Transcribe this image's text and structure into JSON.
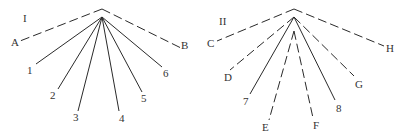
{
  "diagrams": [
    {
      "title": "I",
      "title_pos": [
        23,
        22
      ],
      "apex_outer": [
        102,
        9
      ],
      "apex_inner": [
        102,
        17
      ],
      "lines": [
        {
          "label": "A",
          "style": "dashed",
          "from": "outer",
          "end": [
            20,
            41
          ],
          "label_pos": [
            11,
            46
          ]
        },
        {
          "label": "B",
          "style": "dashed",
          "from": "outer",
          "end": [
            181,
            48
          ],
          "label_pos": [
            181,
            49
          ]
        },
        {
          "label": "1",
          "style": "solid",
          "from": "inner",
          "end": [
            36,
            64
          ],
          "label_pos": [
            27,
            74
          ]
        },
        {
          "label": "2",
          "style": "solid",
          "from": "inner",
          "end": [
            58,
            89
          ],
          "label_pos": [
            50,
            99
          ]
        },
        {
          "label": "3",
          "style": "solid",
          "from": "inner",
          "end": [
            78,
            111
          ],
          "label_pos": [
            73,
            121
          ]
        },
        {
          "label": "4",
          "style": "solid",
          "from": "inner",
          "end": [
            119,
            111
          ],
          "label_pos": [
            119,
            122
          ]
        },
        {
          "label": "5",
          "style": "solid",
          "from": "inner",
          "end": [
            142,
            92
          ],
          "label_pos": [
            141,
            102
          ]
        },
        {
          "label": "6",
          "style": "solid",
          "from": "inner",
          "end": [
            162,
            67
          ],
          "label_pos": [
            163,
            77
          ]
        }
      ]
    },
    {
      "title": "II",
      "title_pos": [
        219,
        25
      ],
      "apex_outer": [
        294,
        9
      ],
      "apex_inner": [
        294,
        17
      ],
      "apex_core": [
        294,
        31
      ],
      "lines": [
        {
          "label": "C",
          "style": "dashed",
          "from": "outer",
          "end": [
            217,
            41
          ],
          "label_pos": [
            207,
            47
          ]
        },
        {
          "label": "H",
          "style": "dashed",
          "from": "outer",
          "end": [
            384,
            46
          ],
          "label_pos": [
            386,
            52
          ]
        },
        {
          "label": "D",
          "style": "dashed",
          "from": "inner",
          "end": [
            230,
            70
          ],
          "label_pos": [
            224,
            81
          ]
        },
        {
          "label": "G",
          "style": "dashed",
          "from": "inner",
          "end": [
            354,
            76
          ],
          "label_pos": [
            355,
            88
          ]
        },
        {
          "label": "7",
          "style": "solid",
          "from": "inner",
          "end": [
            250,
            94
          ],
          "label_pos": [
            243,
            105
          ]
        },
        {
          "label": "8",
          "style": "solid",
          "from": "inner",
          "end": [
            335,
            100
          ],
          "label_pos": [
            336,
            112
          ]
        },
        {
          "label": "E",
          "style": "dashed",
          "from": "core",
          "end": [
            269,
            120
          ],
          "label_pos": [
            262,
            131
          ]
        },
        {
          "label": "F",
          "style": "dashed",
          "from": "core",
          "end": [
            313,
            118
          ],
          "label_pos": [
            313,
            129
          ]
        }
      ]
    }
  ]
}
